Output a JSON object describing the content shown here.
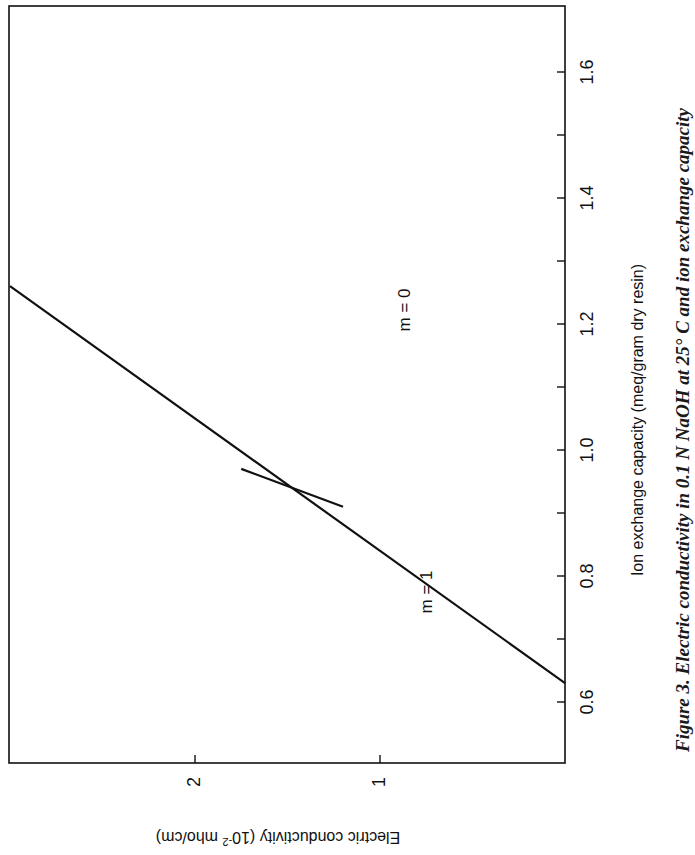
{
  "figure": {
    "caption_prefix": "Figure 3. ",
    "caption_text": "Electric conductivity in 0.1 N NaOH at 25° C and ion exchange capacity"
  },
  "chart_data": {
    "type": "line",
    "title": "Figure 3. Electric conductivity in 0.1 N NaOH at 25° C and ion exchange capacity",
    "orientation": "rotated 90° (x-axis drawn vertically on right side, y-axis drawn horizontally along bottom)",
    "xlabel": "Ion exchange capacity (meq/gram dry resin)",
    "ylabel": "Electric conductivity (10⁻² mho/cm)",
    "x_ticks": [
      0.6,
      0.8,
      1.0,
      1.2,
      1.4,
      1.6
    ],
    "x_tick_labels": [
      "0.6",
      "0.8",
      "1.0",
      "1.2",
      "1.4",
      "1.6"
    ],
    "y_ticks": [
      1,
      2
    ],
    "y_tick_labels": [
      "1",
      "2"
    ],
    "xlim": [
      0.5,
      1.65
    ],
    "ylim": [
      0,
      3.0
    ],
    "grid": false,
    "legend": "none (inline labels)",
    "series": [
      {
        "name": "m = 0",
        "label": "m = 0",
        "x": [
          0.63,
          1.26
        ],
        "y": [
          0.0,
          3.0
        ]
      },
      {
        "name": "m = 1",
        "label": "m = 1",
        "x": [
          0.91,
          0.97
        ],
        "y": [
          1.2,
          1.75
        ]
      }
    ]
  },
  "axes": {
    "x_label": "Ion exchange capacity (meq/gram dry resin)",
    "y_label_main": "Electric conductivity (10",
    "y_label_sup": "-2",
    "y_label_end": " mho/cm)"
  },
  "annotations": {
    "m0": "m = 0",
    "m1": "m = 1"
  }
}
